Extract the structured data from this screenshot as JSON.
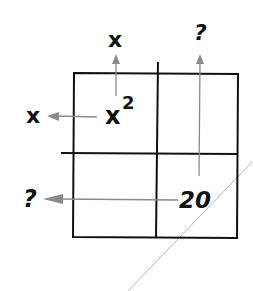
{
  "diagram": {
    "type": "area-model-factoring",
    "grid": {
      "rows": 2,
      "cols": 2
    },
    "cells": {
      "top_left": "x",
      "top_left_exp": "2",
      "top_right": "",
      "bottom_left": "",
      "bottom_right": "20"
    },
    "labels": {
      "col1_top": "x",
      "col2_top": "?",
      "row1_left": "x",
      "row2_left": "?"
    },
    "colors": {
      "grid_line": "#111111",
      "arrow": "#8a8a8a",
      "diagonal_line": "#b0b0b0"
    }
  }
}
